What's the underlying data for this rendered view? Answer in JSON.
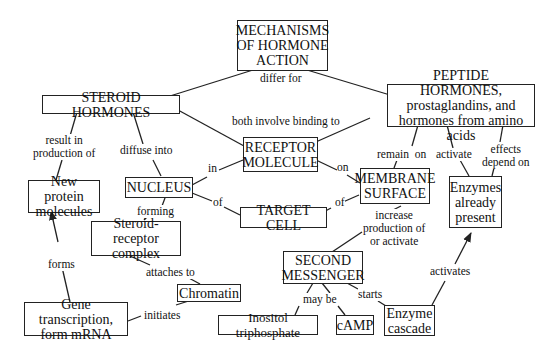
{
  "title": "MECHANISMS OF HORMONE ACTION",
  "nodes": {
    "mechanisms": "MECHANISMS\nOF HORMONE\nACTION",
    "steroid": "STEROID HORMONES",
    "peptide": "PEPTIDE HORMONES,\nprostaglandins, and\nhormones from amino acids",
    "receptor": "RECEPTOR\nMOLECULE",
    "nucleus": "NUCLEUS",
    "membrane": "MEMBRANE\nSURFACE",
    "target_cell": "TARGET CELL",
    "new_protein": "New protein\nmolecules",
    "enzymes_present": "Enzymes\nalready\npresent",
    "steroid_receptor": "Steroid-receptor\ncomplex",
    "second_messenger": "SECOND\nMESSENGER",
    "chromatin": "Chromatin",
    "gene_transcription": "Gene transcription,\nform mRNA",
    "inositol": "Inositol triphosphate",
    "camp": "cAMP",
    "enzyme_cascade": "Enzyme\ncascade"
  },
  "links": {
    "differ_for": "differ for",
    "both_involve": "both involve binding to",
    "result_in": "result in\nproduction of",
    "diffuse_into": "diffuse into",
    "in": "in",
    "on": "on",
    "of_left": "of",
    "of_right": "of",
    "remain_on": "remain  on",
    "activate": "activate",
    "effects_depend": "effects\ndepend on",
    "forming": "forming",
    "increase": "increase\nproduction of\nor activate",
    "forms": "forms",
    "attaches_to": "attaches to",
    "initiates": "initiates",
    "may_be": "may be",
    "starts": "starts",
    "activates": "activates"
  },
  "colors": {
    "line": "#222222",
    "background": "#ffffff"
  }
}
